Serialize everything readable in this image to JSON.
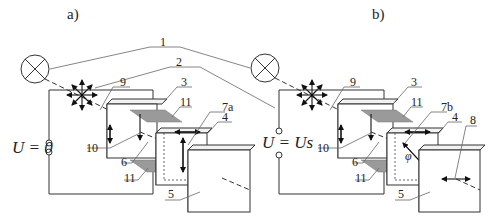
{
  "figure": {
    "panels": [
      {
        "id": "a",
        "title": "a)",
        "voltage_label": "U = 0",
        "labels": {
          "n3": "3",
          "n4": "4",
          "n5": "5",
          "n6": "6",
          "n7": "7a",
          "n9": "9",
          "n10": "10",
          "n11_top": "11",
          "n11_bottom": "11"
        }
      },
      {
        "id": "b",
        "title": "b)",
        "voltage_label": "U = Us",
        "labels": {
          "n3": "3",
          "n4": "4",
          "n5": "5",
          "n6": "6",
          "n7": "7b",
          "n8": "8",
          "n9": "9",
          "n10": "10",
          "n11_top": "11",
          "n11_bottom": "11",
          "angle": "φ"
        }
      }
    ],
    "shared_labels": {
      "n1": "1",
      "n2": "2"
    },
    "symbols": {
      "light_source": "circle-with-x (lamp)",
      "polarizer": "radial arrows (unpolarized light)"
    },
    "colors": {
      "line": "#333333",
      "electrode": "#9a9a9a",
      "background": "#ffffff"
    }
  }
}
